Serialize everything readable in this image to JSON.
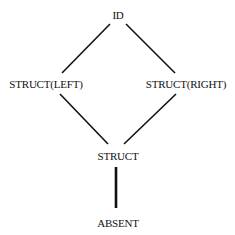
{
  "diagram": {
    "type": "lattice",
    "nodes": [
      {
        "id": "id",
        "label": "ID"
      },
      {
        "id": "struct_left",
        "label": "STRUCT(LEFT)"
      },
      {
        "id": "struct_right",
        "label": "STRUCT(RIGHT)"
      },
      {
        "id": "struct",
        "label": "STRUCT"
      },
      {
        "id": "absent",
        "label": "ABSENT"
      }
    ],
    "edges": [
      {
        "from": "id",
        "to": "struct_left",
        "style": "normal"
      },
      {
        "from": "id",
        "to": "struct_right",
        "style": "normal"
      },
      {
        "from": "struct_left",
        "to": "struct",
        "style": "normal"
      },
      {
        "from": "struct_right",
        "to": "struct",
        "style": "normal"
      },
      {
        "from": "struct",
        "to": "absent",
        "style": "bold"
      }
    ],
    "line_color": "#111111",
    "background": "#ffffff"
  }
}
